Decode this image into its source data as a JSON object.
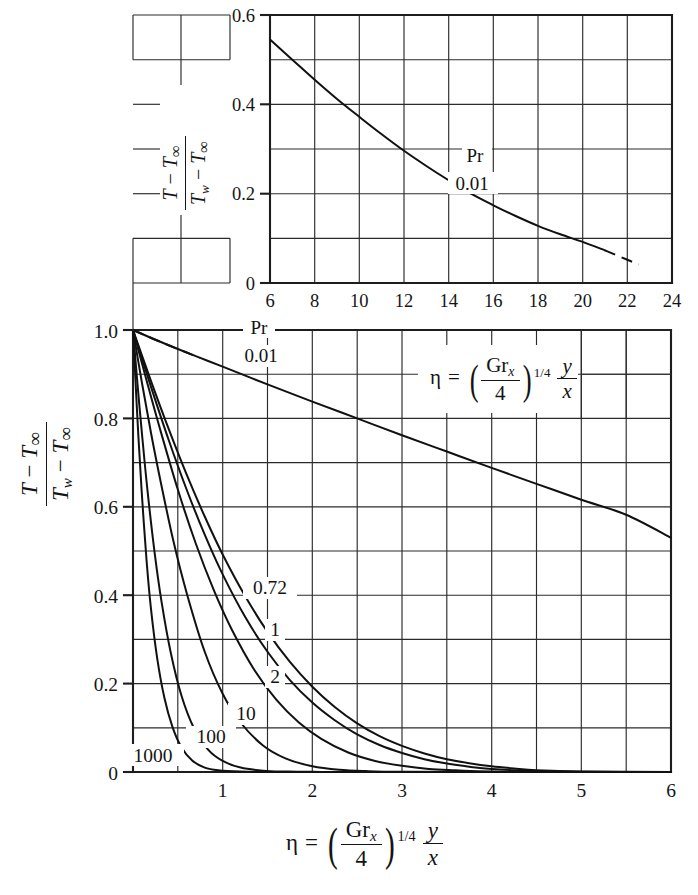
{
  "figure": {
    "background": "#ffffff",
    "ink_color": "#141414"
  },
  "main_chart": {
    "y_axis": {
      "label_numerator": "T − T∞",
      "label_denominator": "Tw − T∞",
      "ticks": [
        "1.0",
        "0.8",
        "0.6",
        "0.4",
        "0.2",
        "0"
      ],
      "tick_values": [
        1.0,
        0.8,
        0.6,
        0.4,
        0.2,
        0
      ],
      "min": 0,
      "max": 1.0,
      "minor_step": 0.1
    },
    "x_axis": {
      "ticks": [
        "1",
        "2",
        "3",
        "4",
        "5",
        "6"
      ],
      "tick_values": [
        1,
        2,
        3,
        4,
        5,
        6
      ],
      "min": 0,
      "max": 6,
      "minor_step": 0.5,
      "label_eta": "η",
      "label_equals": "=",
      "label_gr": "Gr",
      "label_gr_sub": "x",
      "label_four": "4",
      "label_exponent": "1/4",
      "label_y": "y",
      "label_x": "x"
    },
    "pr_legend": {
      "title": "Pr",
      "value": "0.01"
    },
    "curve_labels": [
      "0.72",
      "1",
      "2",
      "10",
      "100",
      "1000"
    ]
  },
  "inset_chart": {
    "y_axis": {
      "label_numerator": "T − T∞",
      "label_denominator": "Tw − T∞",
      "ticks": [
        "0.6",
        "0.4",
        "0.2",
        "0"
      ],
      "tick_values": [
        0.6,
        0.4,
        0.2,
        0
      ],
      "min": 0,
      "max": 0.6,
      "minor_step": 0.1
    },
    "x_axis": {
      "ticks": [
        "6",
        "8",
        "10",
        "12",
        "14",
        "16",
        "18",
        "20",
        "22",
        "24"
      ],
      "tick_values": [
        6,
        8,
        10,
        12,
        14,
        16,
        18,
        20,
        22,
        24
      ],
      "min": 6,
      "max": 24,
      "minor_step": 2
    },
    "pr_legend": {
      "title": "Pr",
      "value": "0.01"
    }
  },
  "chart_data": {
    "type": "line",
    "title": "",
    "subtitle": "",
    "xlabel": "eta = (Gr_x/4)^(1/4) * y/x",
    "ylabel": "(T - T_inf)/(T_w - T_inf)",
    "xlim": [
      0,
      6
    ],
    "ylim": [
      0,
      1.0
    ],
    "grid": true,
    "legend": "inline curve labels (Pr values)",
    "annotations": [
      "Pr",
      "0.01",
      "eta = (Gr_x/4)^(1/4) y/x"
    ],
    "series": [
      {
        "name": "Pr = 0.01",
        "label": "0.01",
        "style": "solid-with-dashed-head",
        "x": [
          0,
          0.25,
          0.5,
          0.75,
          1.0,
          1.5,
          2.0,
          2.5,
          3.0,
          3.5,
          4.0,
          4.5,
          5.0,
          5.5,
          6.0
        ],
        "y": [
          1.0,
          0.978,
          0.957,
          0.937,
          0.917,
          0.877,
          0.838,
          0.8,
          0.762,
          0.725,
          0.688,
          0.652,
          0.616,
          0.582,
          0.53
        ]
      },
      {
        "name": "Pr = 0.72",
        "label": "0.72",
        "style": "solid",
        "x": [
          0,
          0.2,
          0.4,
          0.6,
          0.8,
          1.0,
          1.25,
          1.5,
          1.75,
          2.0,
          2.25,
          2.5,
          2.75,
          3.0,
          3.25,
          3.5,
          3.75,
          4.0,
          4.25,
          4.5,
          5.0,
          6.0
        ],
        "y": [
          1.0,
          0.885,
          0.775,
          0.672,
          0.578,
          0.492,
          0.398,
          0.317,
          0.249,
          0.193,
          0.147,
          0.11,
          0.081,
          0.059,
          0.042,
          0.029,
          0.02,
          0.013,
          0.008,
          0.004,
          0.001,
          0.0
        ]
      },
      {
        "name": "Pr = 1",
        "label": "1",
        "style": "solid",
        "x": [
          0,
          0.2,
          0.4,
          0.6,
          0.8,
          1.0,
          1.25,
          1.5,
          1.75,
          2.0,
          2.25,
          2.5,
          2.75,
          3.0,
          3.25,
          3.5,
          3.75,
          4.0,
          4.5,
          5.0,
          6.0
        ],
        "y": [
          1.0,
          0.872,
          0.75,
          0.638,
          0.537,
          0.447,
          0.351,
          0.272,
          0.208,
          0.157,
          0.117,
          0.085,
          0.061,
          0.043,
          0.029,
          0.019,
          0.012,
          0.007,
          0.002,
          0.0005,
          0.0
        ]
      },
      {
        "name": "Pr = 2",
        "label": "2",
        "style": "solid",
        "x": [
          0,
          0.15,
          0.3,
          0.5,
          0.7,
          0.9,
          1.1,
          1.35,
          1.6,
          1.85,
          2.1,
          2.4,
          2.7,
          3.0,
          3.3,
          3.6,
          4.0,
          5.0,
          6.0
        ],
        "y": [
          1.0,
          0.887,
          0.777,
          0.639,
          0.517,
          0.412,
          0.323,
          0.232,
          0.163,
          0.112,
          0.075,
          0.044,
          0.025,
          0.014,
          0.007,
          0.004,
          0.001,
          0.0,
          0.0
        ]
      },
      {
        "name": "Pr = 10",
        "label": "10",
        "style": "solid",
        "x": [
          0,
          0.1,
          0.2,
          0.3,
          0.45,
          0.6,
          0.8,
          1.0,
          1.2,
          1.45,
          1.7,
          2.0,
          2.3,
          2.6,
          3.0,
          4.0,
          6.0
        ],
        "y": [
          1.0,
          0.88,
          0.768,
          0.665,
          0.523,
          0.404,
          0.272,
          0.177,
          0.112,
          0.06,
          0.031,
          0.013,
          0.005,
          0.002,
          0.0005,
          0.0,
          0.0
        ]
      },
      {
        "name": "Pr = 100",
        "label": "100",
        "style": "solid",
        "x": [
          0,
          0.05,
          0.1,
          0.16,
          0.24,
          0.32,
          0.42,
          0.54,
          0.68,
          0.84,
          1.0,
          1.2,
          1.45,
          1.7,
          2.0,
          3.0,
          6.0
        ],
        "y": [
          1.0,
          0.878,
          0.765,
          0.64,
          0.498,
          0.383,
          0.271,
          0.173,
          0.099,
          0.05,
          0.025,
          0.01,
          0.003,
          0.001,
          0.0003,
          0.0,
          0.0
        ]
      },
      {
        "name": "Pr = 1000",
        "label": "1000",
        "style": "solid",
        "x": [
          0,
          0.03,
          0.06,
          0.1,
          0.15,
          0.2,
          0.27,
          0.35,
          0.44,
          0.54,
          0.66,
          0.8,
          0.95,
          1.2,
          1.5,
          2.0,
          6.0
        ],
        "y": [
          1.0,
          0.876,
          0.76,
          0.625,
          0.482,
          0.37,
          0.257,
          0.168,
          0.102,
          0.056,
          0.026,
          0.01,
          0.004,
          0.001,
          0.0002,
          0.0,
          0.0
        ]
      }
    ],
    "inset": {
      "type": "line",
      "xlabel": "eta = (Gr_x/4)^(1/4) * y/x",
      "ylabel": "(T - T_inf)/(T_w - T_inf)",
      "xlim": [
        6,
        24
      ],
      "ylim": [
        0,
        0.6
      ],
      "grid": true,
      "annotations": [
        "Pr",
        "0.01"
      ],
      "series": [
        {
          "name": "Pr = 0.01",
          "label": "0.01",
          "style": "solid-with-dashed-tail",
          "x": [
            6,
            7,
            8,
            9,
            10,
            11,
            12,
            13,
            14,
            15,
            16,
            17,
            18,
            19,
            20,
            21,
            22,
            22.5
          ],
          "y": [
            0.545,
            0.5,
            0.455,
            0.412,
            0.372,
            0.333,
            0.296,
            0.262,
            0.23,
            0.2,
            0.174,
            0.15,
            0.128,
            0.109,
            0.092,
            0.073,
            0.052,
            0.042
          ]
        }
      ]
    }
  }
}
